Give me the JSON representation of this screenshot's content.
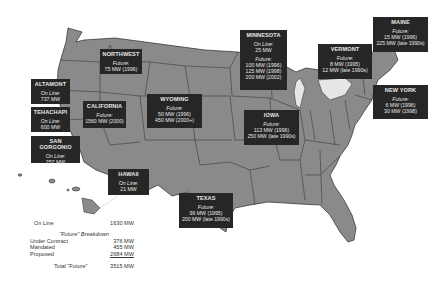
{
  "map": {
    "land_color": "#8a8a8a",
    "border_color": "#2a2a2a",
    "box_color": "#262626",
    "lake_color": "#e6e6e6"
  },
  "regions": [
    {
      "id": "northwest",
      "name": "NORTHWEST",
      "lines": [
        {
          "t": "Future:",
          "i": true
        },
        {
          "t": "75 MW (1996)"
        }
      ]
    },
    {
      "id": "altamont",
      "name": "ALTAMONT",
      "lines": [
        {
          "t": "On Line:",
          "i": true
        },
        {
          "t": "737 MW"
        }
      ]
    },
    {
      "id": "tehachapi",
      "name": "TEHACHAPI",
      "lines": [
        {
          "t": "On Line:",
          "i": true
        },
        {
          "t": "600 MW"
        }
      ]
    },
    {
      "id": "san-gorgonio",
      "name": "SAN GORGONIO",
      "lines": [
        {
          "t": "On Line:",
          "i": true
        },
        {
          "t": "257 MW"
        }
      ]
    },
    {
      "id": "california",
      "name": "CALIFORNIA",
      "lines": [
        {
          "t": "Future:",
          "i": true
        },
        {
          "t": "1560 MW (2000)"
        }
      ]
    },
    {
      "id": "wyoming",
      "name": "WYOMING",
      "lines": [
        {
          "t": "Future:",
          "i": true
        },
        {
          "t": "50 MW (1996)"
        },
        {
          "t": "450 MW (2000+)"
        }
      ]
    },
    {
      "id": "minnesota",
      "name": "MINNESOTA",
      "lines": [
        {
          "t": "On Line:",
          "i": true
        },
        {
          "t": "25 MW"
        },
        {
          "gap": true
        },
        {
          "t": "Future:",
          "i": true
        },
        {
          "t": "100 MW (1996)"
        },
        {
          "t": "125 MW (1998)"
        },
        {
          "t": "200 MW (2002)"
        }
      ]
    },
    {
      "id": "iowa",
      "name": "IOWA",
      "lines": [
        {
          "t": "Future:",
          "i": true
        },
        {
          "t": "113 MW (1996)"
        },
        {
          "t": "250 MW (late 1990s)"
        }
      ]
    },
    {
      "id": "vermont",
      "name": "VERMONT",
      "lines": [
        {
          "t": "Future:",
          "i": true
        },
        {
          "t": "8 MW (1995)"
        },
        {
          "t": "12 MW (late 1990s)"
        }
      ]
    },
    {
      "id": "maine",
      "name": "MAINE",
      "lines": [
        {
          "t": "Future:",
          "i": true
        },
        {
          "t": "15 MW (1996)"
        },
        {
          "t": "225 MW (late 1990s)"
        }
      ]
    },
    {
      "id": "new-york",
      "name": "NEW YORK",
      "lines": [
        {
          "t": "Future:",
          "i": true
        },
        {
          "t": "6 MW (1996)"
        },
        {
          "t": "30 MW (1998)"
        }
      ]
    },
    {
      "id": "hawaii",
      "name": "HAWAII",
      "lines": [
        {
          "t": "On Line:",
          "i": true
        },
        {
          "t": "21 MW"
        }
      ]
    },
    {
      "id": "texas",
      "name": "TEXAS",
      "lines": [
        {
          "t": "Future:",
          "i": true
        },
        {
          "t": "96 MW (1995)"
        },
        {
          "t": "200 MW (late 1990s)"
        }
      ]
    }
  ],
  "summary": {
    "online_label": "On Line",
    "online_value": "1630 MW",
    "breakdown_title": "\"Future\" Breakdown",
    "under_contract_label": "Under Contract",
    "under_contract_value": "376 MW",
    "mandated_label": "Mandated",
    "mandated_value": "455 MW",
    "proposed_label": "Proposed",
    "proposed_value": "2684 MW",
    "total_label": "Total \"Future\"",
    "total_value": "3515 MW"
  }
}
